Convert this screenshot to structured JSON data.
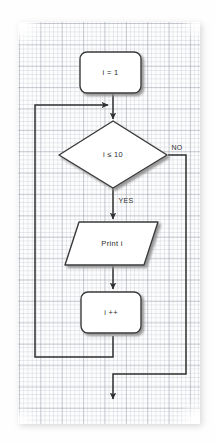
{
  "diagram": {
    "kind": "flowchart",
    "colors": {
      "shape_fill": "#ffffff",
      "shape_stroke": "#3a3a3a",
      "connector": "#2f2f2f",
      "shadow": "#9a9a9a",
      "paper": "#fdfdfd",
      "grid_minor": "#afb6c3",
      "grid_major": "#969ba5"
    },
    "nodes": [
      {
        "id": "init",
        "type": "process",
        "label": "i = 1"
      },
      {
        "id": "condition",
        "type": "decision",
        "label": "i ≤ 10"
      },
      {
        "id": "output",
        "type": "input-output",
        "label": "Print i"
      },
      {
        "id": "increment",
        "type": "process",
        "label": "i ++"
      }
    ],
    "edge_labels": {
      "yes": "YES",
      "no": "NO"
    },
    "edges": [
      {
        "from": "init",
        "to": "condition",
        "label": ""
      },
      {
        "from": "condition",
        "to": "output",
        "label": "YES"
      },
      {
        "from": "condition",
        "to": "exit",
        "label": "NO"
      },
      {
        "from": "output",
        "to": "increment",
        "label": ""
      },
      {
        "from": "increment",
        "to": "condition",
        "label": ""
      }
    ]
  }
}
